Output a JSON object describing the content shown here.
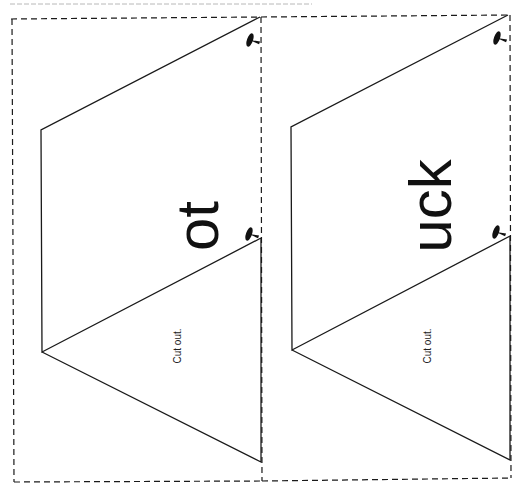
{
  "page": {
    "background": "#ffffff",
    "line_color": "#1a1a1a"
  },
  "cards": [
    {
      "word_ending": "ot",
      "instruction": "Cut out."
    },
    {
      "word_ending": "uck",
      "instruction": "Cut out."
    }
  ]
}
